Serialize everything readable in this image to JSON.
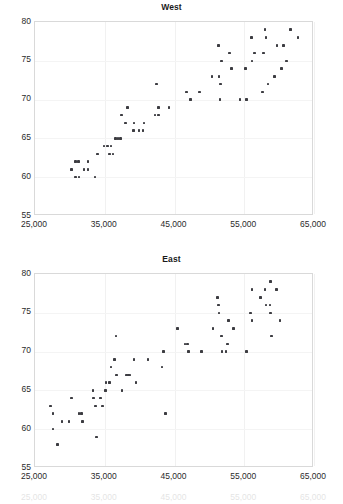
{
  "page": {
    "background_color": "#ffffff",
    "marker_color": "#3c3c41",
    "axis_color": "#d9d9d9",
    "text_color": "#231f20"
  },
  "charts": [
    {
      "id": "west",
      "title": "West",
      "y_ticks": [
        "80",
        "75",
        "70",
        "65",
        "60",
        "55"
      ],
      "x_ticks": [
        "25,000",
        "35,000",
        "45,000",
        "55,000",
        "65,000"
      ]
    },
    {
      "id": "east",
      "title": "East",
      "y_ticks": [
        "80",
        "75",
        "70",
        "65",
        "60",
        "55"
      ],
      "x_ticks": [
        "25,000",
        "35,000",
        "45,000",
        "55,000",
        "65,000"
      ]
    }
  ],
  "ghost_x_ticks": [
    "25,000",
    "35,000",
    "45,000",
    "55,000",
    "65,000"
  ],
  "chart_data": [
    {
      "type": "scatter",
      "title": "West",
      "xlabel": "",
      "ylabel": "",
      "xlim": [
        25000,
        65000
      ],
      "ylim": [
        55,
        80
      ],
      "xticks": [
        25000,
        35000,
        45000,
        55000,
        65000
      ],
      "yticks": [
        55,
        60,
        65,
        70,
        75,
        80
      ],
      "grid": true,
      "legend": "none",
      "series": [
        {
          "name": "West",
          "points": [
            [
              30200,
              61
            ],
            [
              30800,
              62
            ],
            [
              31200,
              62
            ],
            [
              30800,
              60
            ],
            [
              31300,
              60
            ],
            [
              32000,
              61
            ],
            [
              32600,
              61
            ],
            [
              32600,
              62
            ],
            [
              33600,
              60
            ],
            [
              34000,
              63
            ],
            [
              34900,
              64
            ],
            [
              35400,
              64
            ],
            [
              35900,
              64
            ],
            [
              35700,
              63
            ],
            [
              36200,
              63
            ],
            [
              36500,
              65
            ],
            [
              36900,
              65
            ],
            [
              37300,
              65
            ],
            [
              37400,
              68
            ],
            [
              38000,
              67
            ],
            [
              38300,
              69
            ],
            [
              39200,
              67
            ],
            [
              39100,
              66
            ],
            [
              39900,
              66
            ],
            [
              40500,
              66
            ],
            [
              40600,
              67
            ],
            [
              42200,
              68
            ],
            [
              42700,
              68
            ],
            [
              42400,
              72
            ],
            [
              42700,
              69
            ],
            [
              44200,
              69
            ],
            [
              46700,
              71
            ],
            [
              47300,
              70
            ],
            [
              48600,
              71
            ],
            [
              50400,
              73
            ],
            [
              51300,
              77
            ],
            [
              51400,
              73
            ],
            [
              51700,
              75
            ],
            [
              51600,
              72
            ],
            [
              51500,
              70
            ],
            [
              52900,
              76
            ],
            [
              53200,
              74
            ],
            [
              54400,
              70
            ],
            [
              55300,
              70
            ],
            [
              55200,
              74
            ],
            [
              56100,
              75
            ],
            [
              56000,
              78
            ],
            [
              56500,
              76
            ],
            [
              57600,
              71
            ],
            [
              58100,
              78
            ],
            [
              57800,
              76
            ],
            [
              58000,
              79
            ],
            [
              58400,
              72
            ],
            [
              59300,
              73
            ],
            [
              59700,
              77
            ],
            [
              60300,
              74
            ],
            [
              60600,
              77
            ],
            [
              61100,
              75
            ],
            [
              61600,
              79
            ],
            [
              62700,
              78
            ]
          ]
        }
      ]
    },
    {
      "type": "scatter",
      "title": "East",
      "xlabel": "",
      "ylabel": "",
      "xlim": [
        25000,
        65000
      ],
      "ylim": [
        55,
        80
      ],
      "xticks": [
        25000,
        35000,
        45000,
        55000,
        65000
      ],
      "yticks": [
        55,
        60,
        65,
        70,
        75,
        80
      ],
      "grid": true,
      "legend": "none",
      "series": [
        {
          "name": "East",
          "points": [
            [
              27200,
              63
            ],
            [
              27600,
              62
            ],
            [
              27600,
              60
            ],
            [
              28200,
              58
            ],
            [
              28900,
              61
            ],
            [
              29900,
              61
            ],
            [
              30200,
              64
            ],
            [
              31300,
              62
            ],
            [
              31700,
              62
            ],
            [
              31800,
              61
            ],
            [
              33300,
              65
            ],
            [
              33400,
              64
            ],
            [
              33700,
              63
            ],
            [
              33800,
              59
            ],
            [
              34400,
              64
            ],
            [
              34700,
              63
            ],
            [
              35100,
              65
            ],
            [
              35200,
              66
            ],
            [
              35700,
              66
            ],
            [
              35900,
              68
            ],
            [
              36400,
              69
            ],
            [
              36700,
              67
            ],
            [
              36600,
              72
            ],
            [
              37500,
              65
            ],
            [
              38100,
              67
            ],
            [
              38400,
              67
            ],
            [
              38600,
              67
            ],
            [
              39200,
              69
            ],
            [
              39500,
              66
            ],
            [
              41200,
              69
            ],
            [
              43200,
              68
            ],
            [
              43400,
              70
            ],
            [
              43700,
              62
            ],
            [
              45400,
              73
            ],
            [
              46500,
              71
            ],
            [
              46900,
              71
            ],
            [
              47000,
              70
            ],
            [
              48900,
              70
            ],
            [
              50500,
              73
            ],
            [
              51200,
              77
            ],
            [
              51300,
              76
            ],
            [
              51400,
              75
            ],
            [
              51700,
              72
            ],
            [
              51800,
              70
            ],
            [
              52400,
              70
            ],
            [
              52600,
              71
            ],
            [
              52700,
              74
            ],
            [
              53500,
              73
            ],
            [
              55300,
              70
            ],
            [
              55900,
              75
            ],
            [
              56100,
              74
            ],
            [
              56100,
              78
            ],
            [
              57300,
              77
            ],
            [
              58000,
              78
            ],
            [
              58100,
              76
            ],
            [
              58800,
              79
            ],
            [
              58700,
              76
            ],
            [
              58800,
              75
            ],
            [
              58900,
              72
            ],
            [
              59600,
              78
            ],
            [
              60100,
              74
            ]
          ]
        }
      ]
    }
  ]
}
